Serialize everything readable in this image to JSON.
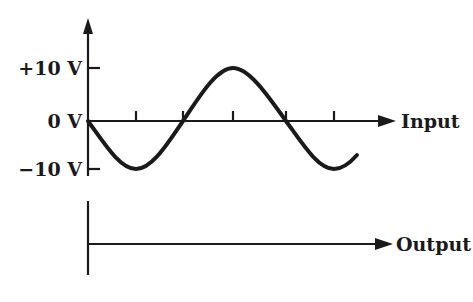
{
  "diagram": {
    "colors": {
      "ink": "#1a1a1a",
      "background": "#ffffff"
    },
    "input_graph": {
      "y_labels": [
        "+10 V",
        "0 V",
        "−10 V"
      ],
      "x_axis_label": "Input",
      "waveform": "sine (inverted start: begins at 0 V, goes negative first)",
      "amplitude": "10 V",
      "x_ticks": 5
    },
    "output_graph": {
      "x_axis_label": "Output",
      "waveform": "flat line at 0 V"
    }
  }
}
